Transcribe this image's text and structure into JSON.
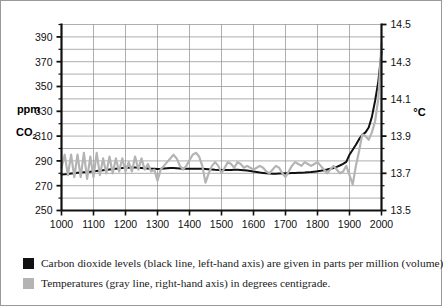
{
  "figure": {
    "background": "#ffffff",
    "border_color": "#9a9a9a"
  },
  "chart_data": {
    "type": "line",
    "title": "",
    "subtitle": "",
    "xlabel": "",
    "grid": true,
    "legend_position": "below-plot",
    "x": [
      1000,
      1010,
      1020,
      1030,
      1040,
      1050,
      1060,
      1070,
      1080,
      1090,
      1100,
      1110,
      1120,
      1130,
      1140,
      1150,
      1160,
      1170,
      1180,
      1190,
      1200,
      1210,
      1220,
      1230,
      1240,
      1250,
      1260,
      1270,
      1280,
      1290,
      1300,
      1310,
      1320,
      1330,
      1340,
      1350,
      1360,
      1370,
      1380,
      1390,
      1400,
      1410,
      1420,
      1430,
      1440,
      1450,
      1460,
      1470,
      1480,
      1490,
      1500,
      1510,
      1520,
      1530,
      1540,
      1550,
      1560,
      1570,
      1580,
      1590,
      1600,
      1610,
      1620,
      1630,
      1640,
      1650,
      1660,
      1670,
      1680,
      1690,
      1700,
      1710,
      1720,
      1730,
      1740,
      1750,
      1760,
      1770,
      1780,
      1790,
      1800,
      1810,
      1820,
      1830,
      1840,
      1850,
      1860,
      1870,
      1880,
      1890,
      1900,
      1910,
      1920,
      1930,
      1940,
      1950,
      1960,
      1970,
      1980,
      1990,
      2000
    ],
    "xlim": [
      1000,
      2000
    ],
    "xticks": [
      1000,
      1100,
      1200,
      1300,
      1400,
      1500,
      1600,
      1700,
      1800,
      1900,
      2000
    ],
    "xticklabels": [
      "1000",
      "1100",
      "1200",
      "1300",
      "1400",
      "1500",
      "1600",
      "1700",
      "1800",
      "1900",
      "2000"
    ],
    "axes": [
      {
        "id": "left",
        "name": "ppm-co2-axis",
        "label_line1": "ppm",
        "label_line2": "CO",
        "label_sub": "2",
        "ylim": [
          250,
          400
        ],
        "yticks": [
          250,
          270,
          290,
          310,
          330,
          350,
          370,
          390
        ],
        "yticklabels": [
          "250",
          "270",
          "290",
          "310",
          "330",
          "350",
          "370",
          "390"
        ],
        "minor_tick_step": 10
      },
      {
        "id": "right",
        "name": "celsius-axis",
        "label": "°C",
        "ylim": [
          13.5,
          14.5
        ],
        "yticks": [
          13.5,
          13.7,
          13.9,
          14.1,
          14.3,
          14.5
        ],
        "yticklabels": [
          "13.5",
          "13.7",
          "13.9",
          "14.1",
          "14.3",
          "14.5"
        ],
        "minor_tick_step": 0.0667
      }
    ],
    "series": [
      {
        "name": "Carbon dioxide",
        "axis": "left",
        "color": "#111111",
        "units": "ppm",
        "values": [
          279.0,
          279.2,
          279.5,
          279.8,
          280.1,
          280.4,
          280.6,
          280.8,
          281.0,
          281.3,
          281.6,
          281.9,
          282.2,
          282.5,
          282.8,
          283.1,
          283.4,
          283.7,
          284.0,
          284.2,
          284.4,
          284.5,
          284.6,
          284.6,
          284.5,
          284.3,
          284.1,
          283.9,
          283.7,
          283.6,
          283.5,
          283.6,
          283.8,
          284.0,
          284.2,
          284.2,
          284.1,
          283.9,
          283.7,
          283.6,
          283.6,
          283.6,
          283.7,
          283.7,
          283.6,
          283.4,
          283.2,
          283.0,
          282.8,
          282.7,
          282.6,
          282.6,
          282.6,
          282.7,
          282.8,
          282.8,
          282.7,
          282.5,
          282.2,
          281.8,
          281.4,
          281.0,
          280.6,
          280.3,
          280.0,
          279.8,
          279.7,
          279.7,
          279.8,
          279.9,
          280.0,
          280.1,
          280.2,
          280.3,
          280.4,
          280.5,
          280.6,
          280.8,
          281.0,
          281.3,
          281.6,
          282.0,
          282.5,
          283.0,
          283.6,
          284.3,
          285.2,
          286.3,
          287.6,
          289.2,
          295.0,
          299.0,
          303.0,
          307.5,
          311.0,
          313.0,
          317.0,
          325.5,
          338.5,
          354.0,
          378.0
        ]
      },
      {
        "name": "Temperatures",
        "axis": "right",
        "color": "#b4b4b4",
        "units": "°C",
        "values": [
          13.73,
          13.8,
          13.69,
          13.8,
          13.68,
          13.8,
          13.68,
          13.81,
          13.67,
          13.79,
          13.68,
          13.81,
          13.69,
          13.78,
          13.7,
          13.79,
          13.7,
          13.78,
          13.71,
          13.78,
          13.71,
          13.76,
          13.71,
          13.79,
          13.72,
          13.78,
          13.72,
          13.75,
          13.71,
          13.72,
          13.66,
          13.72,
          13.74,
          13.76,
          13.78,
          13.8,
          13.78,
          13.74,
          13.72,
          13.74,
          13.77,
          13.8,
          13.81,
          13.79,
          13.74,
          13.65,
          13.7,
          13.74,
          13.76,
          13.74,
          13.7,
          13.73,
          13.76,
          13.75,
          13.73,
          13.76,
          13.75,
          13.73,
          13.74,
          13.73,
          13.72,
          13.73,
          13.74,
          13.73,
          13.71,
          13.7,
          13.72,
          13.74,
          13.73,
          13.7,
          13.68,
          13.71,
          13.74,
          13.76,
          13.75,
          13.74,
          13.76,
          13.75,
          13.74,
          13.75,
          13.76,
          13.74,
          13.72,
          13.7,
          13.72,
          13.74,
          13.72,
          13.7,
          13.71,
          13.74,
          13.69,
          13.64,
          13.74,
          13.82,
          13.91,
          13.9,
          13.88,
          13.92,
          13.98,
          14.1,
          14.4
        ]
      }
    ]
  },
  "legend": {
    "entries": [
      {
        "swatch": "black",
        "color": "#111111",
        "text": "Carbon dioxide levels (black line, left-hand axis) are given in parts per million (volume)"
      },
      {
        "swatch": "gray",
        "color": "#b4b4b4",
        "text": "Temperatures (gray line, right-hand axis) in degrees centigrade."
      }
    ]
  }
}
